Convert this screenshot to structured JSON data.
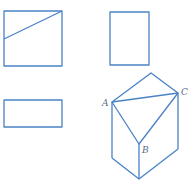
{
  "figure": {
    "stroke_color": "#4a82c6",
    "label_color": "#5a6a85",
    "views": {
      "front_view": {
        "name": "square with diagonal line",
        "x": 4,
        "y": 11,
        "w": 58,
        "h": 55,
        "line": [
          4,
          39,
          62,
          11
        ]
      },
      "side_view": {
        "name": "tall rectangle",
        "x": 110,
        "y": 12,
        "w": 39,
        "h": 53
      },
      "top_view": {
        "name": "wide rectangle",
        "x": 4,
        "y": 100,
        "w": 58,
        "h": 27
      }
    },
    "solid": {
      "vertices": {
        "top": [
          151,
          73
        ],
        "A": [
          112,
          102
        ],
        "C": [
          178,
          93
        ],
        "B": [
          139,
          144
        ],
        "bottom": [
          139,
          179
        ],
        "bottom_left": [
          112,
          158
        ],
        "bottom_right": [
          178,
          149
        ]
      },
      "labels": [
        {
          "text": "A",
          "x": 102,
          "y": 106
        },
        {
          "text": "C",
          "x": 181,
          "y": 95
        },
        {
          "text": "B",
          "x": 142,
          "y": 153
        }
      ]
    }
  }
}
